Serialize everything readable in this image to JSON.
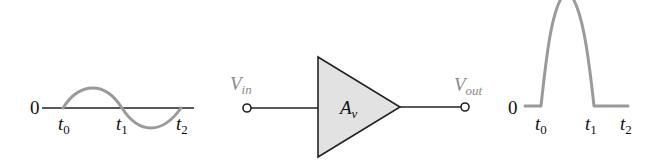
{
  "input_waveform": {
    "zero_label": "0",
    "ticks": [
      {
        "base": "t",
        "sub": "0"
      },
      {
        "base": "t",
        "sub": "1"
      },
      {
        "base": "t",
        "sub": "2"
      }
    ],
    "shape": "full sine cycle (positive half then negative half)"
  },
  "amplifier": {
    "input_label": {
      "base": "V",
      "sub": "in"
    },
    "gain_label": {
      "base": "A",
      "sub": "v"
    },
    "output_label": {
      "base": "V",
      "sub": "out"
    }
  },
  "output_waveform": {
    "zero_label": "0",
    "ticks": [
      {
        "base": "t",
        "sub": "0"
      },
      {
        "base": "t",
        "sub": "1"
      },
      {
        "base": "t",
        "sub": "2"
      }
    ],
    "shape": "amplified positive half-cycle only, zero elsewhere (clipped at top)"
  },
  "colors": {
    "axis": "#222222",
    "waveform": "#9a9a9a",
    "amplifier_fill": "#e2e2e2",
    "amplifier_stroke": "#222222",
    "label_gray": "#8a8a8a"
  }
}
